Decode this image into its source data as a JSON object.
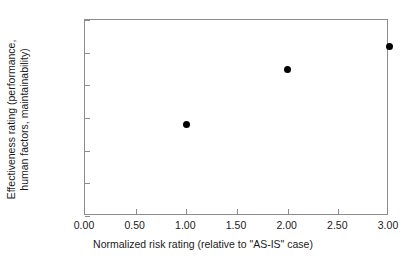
{
  "chart_data": {
    "type": "scatter",
    "title": "",
    "xlabel": "Normalized risk rating (relative to \"AS-IS\" case)",
    "ylabel_line1": "Effectiveness rating (performance,",
    "ylabel_line2": "human factors, maintainability)",
    "ylabel": "Effectiveness rating (performance, human factors, maintainability)",
    "xlim": [
      0.0,
      3.0
    ],
    "ylim": [
      0.0,
      120.0
    ],
    "xticks": [
      "0.00",
      "0.50",
      "1.00",
      "1.50",
      "2.00",
      "2.50",
      "3.00"
    ],
    "xtick_values": [
      0.0,
      0.5,
      1.0,
      1.5,
      2.0,
      2.5,
      3.0
    ],
    "yticks": [
      "0.00",
      "20.00",
      "40.00",
      "60.00",
      "80.00",
      "100.00",
      "120.00"
    ],
    "ytick_values": [
      0.0,
      20.0,
      40.0,
      60.0,
      80.0,
      100.0,
      120.0
    ],
    "grid": false,
    "legend": false,
    "marker": "filled-circle",
    "marker_color": "#000000",
    "frame_color": "#8c8c8c",
    "background_color": "#ffffff",
    "x": [
      1.0,
      2.0,
      3.0
    ],
    "values": [
      56,
      90,
      104
    ],
    "points": [
      {
        "x": 1.0,
        "y": 56
      },
      {
        "x": 2.0,
        "y": 90
      },
      {
        "x": 3.0,
        "y": 104
      }
    ]
  }
}
